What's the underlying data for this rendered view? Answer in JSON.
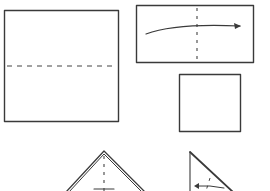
{
  "diagram": {
    "type": "origami-folding-instructions",
    "steps": [
      {
        "id": "step-1",
        "shape": "square",
        "fold": "horizontal valley fold line (dashed)"
      },
      {
        "id": "step-2",
        "shape": "rectangle",
        "fold": "vertical dashed line with curved arrow folding left to right"
      },
      {
        "id": "step-3",
        "shape": "small square",
        "fold": "none"
      },
      {
        "id": "step-4",
        "shape": "triangle",
        "fold": "vertical dashed center line"
      },
      {
        "id": "step-5",
        "shape": "right triangle",
        "fold": "dashed line with arrow"
      }
    ],
    "colors": {
      "stroke": "#3a3a3a",
      "background": "#ffffff"
    }
  }
}
